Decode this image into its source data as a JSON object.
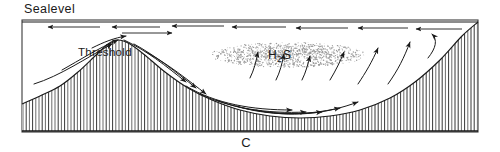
{
  "figure": {
    "panel_label": "C",
    "caption_labels": {
      "sealevel": "Sealevel",
      "threshold": "Threshold",
      "h2s_main": "H",
      "h2s_sub": "2",
      "h2s_tail": "S"
    }
  },
  "colors": {
    "ink": "#1a1a1a",
    "hatch": "#2b2b2b",
    "stipple": "#9a9a9a",
    "frame": "#3a3a3a",
    "background": "#ffffff"
  },
  "diagram": {
    "type": "silled-anoxic-basin-cross-section",
    "frame": {
      "x": 22,
      "y": 20,
      "width": 456,
      "height": 112
    },
    "sealevel_line_y": 22,
    "seafloor_profile": "left shelf rising to Threshold sill crest at x=115, descending into deep basin floor, rising steeply to right shelf",
    "hatching": {
      "style": "vertical-lines",
      "spacing_px": 3.2
    },
    "h2s_cloud": {
      "cx": 288,
      "cy": 55,
      "rx": 78,
      "ry": 13,
      "style": "stipple"
    },
    "surface_current_direction": "leftward",
    "deep_current_direction": "rightward-then-upwelling"
  },
  "chart_data": {
    "type": "line",
    "xlabel": "",
    "ylabel": "",
    "series": [
      {
        "name": "seafloor-profile",
        "x": [
          22,
          40,
          60,
          78,
          95,
          108,
          118,
          130,
          146,
          165,
          188,
          212,
          240,
          270,
          300,
          330,
          360,
          390,
          415,
          440,
          462,
          478
        ],
        "y": [
          104,
          96,
          86,
          72,
          56,
          44,
          40,
          44,
          56,
          72,
          88,
          100,
          110,
          116,
          118,
          116,
          110,
          98,
          82,
          60,
          36,
          22
        ]
      },
      {
        "name": "sealevel",
        "x": [
          22,
          478
        ],
        "y": [
          22,
          22
        ]
      }
    ],
    "annotations": [
      {
        "text": "Sealevel",
        "x": 24,
        "y": 12
      },
      {
        "text": "Threshold",
        "x": 78,
        "y": 55
      },
      {
        "text": "H2S",
        "x": 268,
        "y": 58
      },
      {
        "text": "C",
        "x": 246,
        "y": 146
      }
    ]
  },
  "flow_arrows": {
    "surface_leftward": [
      {
        "x1": 100,
        "y1": 27,
        "x2": 48,
        "y2": 27
      },
      {
        "x1": 160,
        "y1": 27,
        "x2": 112,
        "y2": 27
      },
      {
        "x1": 224,
        "y1": 26,
        "x2": 172,
        "y2": 26
      },
      {
        "x1": 286,
        "y1": 27,
        "x2": 232,
        "y2": 27
      },
      {
        "x1": 348,
        "y1": 28,
        "x2": 296,
        "y2": 28
      },
      {
        "x1": 408,
        "y1": 28,
        "x2": 358,
        "y2": 28
      },
      {
        "x1": 462,
        "y1": 29,
        "x2": 416,
        "y2": 29
      }
    ],
    "surface_rightward": [
      {
        "x1": 122,
        "y1": 33,
        "x2": 172,
        "y2": 33
      }
    ],
    "sill_inflow": [
      {
        "path": "M 34,84 C 60,76 86,58 112,44",
        "dir": "up-right"
      },
      {
        "path": "M 62,70 C 80,60 98,48 118,40",
        "dir": "up-right"
      },
      {
        "path": "M 92,48 C 104,42 114,38 126,36",
        "dir": "up-right"
      }
    ],
    "sill_outflow": [
      {
        "path": "M 124,40 C 146,50 166,66 186,82",
        "dir": "down-right"
      },
      {
        "path": "M 134,44 C 156,56 176,72 196,88",
        "dir": "down-right"
      },
      {
        "path": "M 146,52 C 168,64 188,80 206,94",
        "dir": "down-right"
      }
    ],
    "basin_floor_rightward": [
      {
        "path": "M 186,86 C 216,104 252,110 292,110",
        "dir": "right"
      },
      {
        "path": "M 200,94 C 230,108 266,114 306,112",
        "dir": "right"
      },
      {
        "path": "M 216,100 C 248,112 284,116 322,112",
        "dir": "right"
      },
      {
        "path": "M 236,106 C 268,116 304,116 340,108",
        "dir": "right"
      },
      {
        "path": "M 256,110 C 290,118 326,114 358,102",
        "dir": "right"
      }
    ],
    "upwelling": [
      {
        "path": "M 250,78 C 254,70 256,62 258,52",
        "dir": "up"
      },
      {
        "path": "M 276,80 C 280,72 282,64 284,54",
        "dir": "up"
      },
      {
        "path": "M 302,80 C 306,72 308,64 310,56",
        "dir": "up"
      },
      {
        "path": "M 330,80 C 336,70 340,62 344,52",
        "dir": "up"
      },
      {
        "path": "M 358,84 C 366,72 372,62 378,48",
        "dir": "up"
      },
      {
        "path": "M 388,84 C 398,70 404,58 410,42",
        "dir": "up"
      },
      {
        "path": "M 428,58 C 436,48 438,40 432,34",
        "dir": "up-curl"
      }
    ]
  }
}
